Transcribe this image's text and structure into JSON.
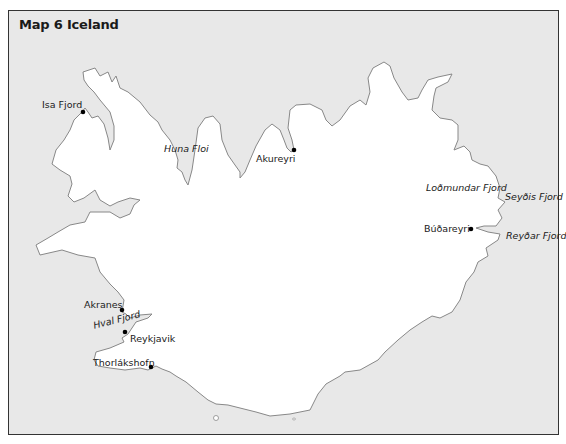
{
  "title": "Map 6 Iceland",
  "colors": {
    "sea": "#e8e8e8",
    "land": "#ffffff",
    "coast": "#888888",
    "frame": "#333333",
    "text": "#1a1a1a"
  },
  "towns": [
    {
      "name": "Isa Fjord",
      "x": 83,
      "y": 112
    },
    {
      "name": "Akureyri",
      "x": 294,
      "y": 150
    },
    {
      "name": "Búðareyri",
      "x": 471,
      "y": 229
    },
    {
      "name": "Akranes",
      "x": 122,
      "y": 310
    },
    {
      "name": "Reykjavik",
      "x": 125,
      "y": 332
    },
    {
      "name": "Thorlákshofn",
      "x": 151,
      "y": 367
    }
  ],
  "water_labels": {
    "huna_floi": "Huna Floi",
    "lodmundar_fjord": "Loðmundar Fjord",
    "seydis_fjord": "Seyðis Fjord",
    "reydar_fjord": "Reyðar Fjord",
    "hval_fjord": "Hval Fjord"
  }
}
